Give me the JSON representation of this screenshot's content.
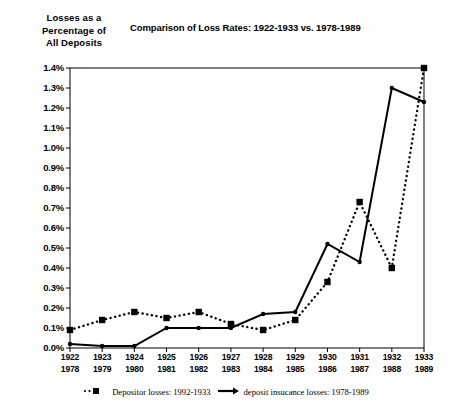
{
  "axis_title": "Losses as a\nPercentage of\nAll Deposits",
  "title": "Comparison of Loss Rates: 1922-1933 vs. 1978-1989",
  "legend": {
    "series1_label": "Depositor losses: 1992-1933",
    "series2_label": "deposit insucance losses: 1978-1989",
    "swatch1": "dotted-square-marker",
    "swatch2": "solid-line-arrow"
  },
  "colors": {
    "ink": "#000000",
    "background": "#ffffff"
  },
  "chart_data": {
    "type": "line",
    "title": "Comparison of Loss Rates: 1922-1933 vs. 1978-1989",
    "xlabel": "",
    "ylabel": "Losses as a Percentage of All Deposits",
    "grid": false,
    "legend_position": "bottom",
    "ylim": [
      0.0,
      1.4
    ],
    "yticks": [
      0.0,
      0.1,
      0.2,
      0.3,
      0.4,
      0.5,
      0.6,
      0.7,
      0.8,
      0.9,
      1.0,
      1.1,
      1.2,
      1.3,
      1.4
    ],
    "ytick_labels": [
      "0.0%",
      "0.1%",
      "0.2%",
      "0.3%",
      "0.4%",
      "0.5%",
      "0.6%",
      "0.7%",
      "0.8%",
      "0.9%",
      "1.0%",
      "1.1%",
      "1.2%",
      "1.3%",
      "1.4%"
    ],
    "categories_top": [
      "1922",
      "1923",
      "1924",
      "1925",
      "1926",
      "1927",
      "1928",
      "1929",
      "1930",
      "1931",
      "1932",
      "1933"
    ],
    "categories_bottom": [
      "1978",
      "1979",
      "1980",
      "1981",
      "1982",
      "1983",
      "1984",
      "1985",
      "1986",
      "1987",
      "1988",
      "1989"
    ],
    "series": [
      {
        "name": "Depositor losses: 1992-1933",
        "style": "dotted",
        "marker": "square",
        "values": [
          0.09,
          0.14,
          0.18,
          0.15,
          0.18,
          0.12,
          0.09,
          0.14,
          0.33,
          0.73,
          0.4,
          1.4
        ]
      },
      {
        "name": "deposit insucance losses: 1978-1989",
        "style": "solid",
        "marker": "dot",
        "values": [
          0.02,
          0.01,
          0.01,
          0.1,
          0.1,
          0.1,
          0.17,
          0.18,
          0.52,
          0.43,
          1.3,
          1.23
        ]
      }
    ]
  }
}
